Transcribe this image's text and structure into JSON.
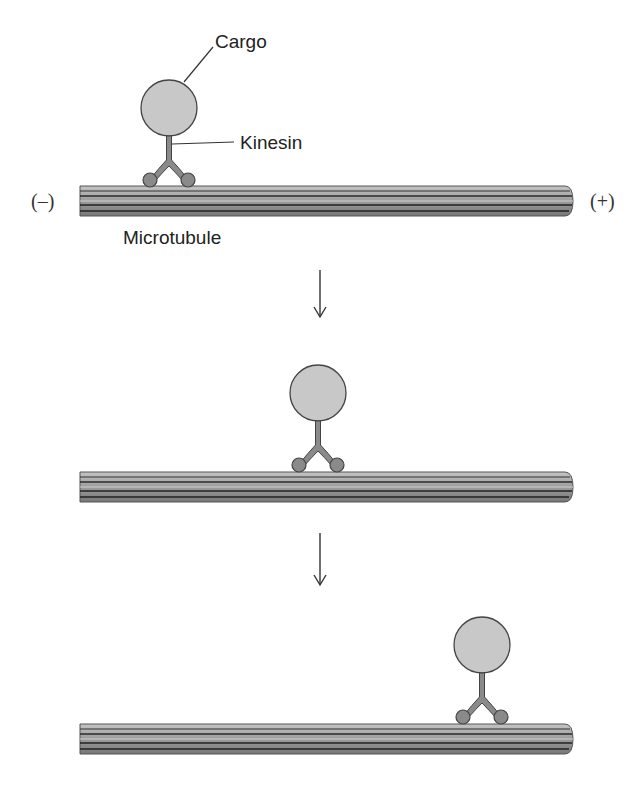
{
  "labels": {
    "cargo": "Cargo",
    "kinesin": "Kinesin",
    "microtubule": "Microtubule",
    "minus_end": "(–)",
    "plus_end": "(+)"
  },
  "panels": [
    {
      "step": 1,
      "cargo_x": 169,
      "description": "Kinesin carrying cargo near minus end of microtubule"
    },
    {
      "step": 2,
      "cargo_x": 318,
      "description": "Kinesin has moved toward middle of microtubule"
    },
    {
      "step": 3,
      "cargo_x": 482,
      "description": "Kinesin has moved near plus end of microtubule"
    }
  ],
  "arrows": [
    {
      "from_step": 1,
      "to_step": 2
    },
    {
      "from_step": 2,
      "to_step": 3
    }
  ],
  "colors": {
    "cargo_fill": "#c8c8c8",
    "outline": "#444444",
    "kinesin_fill": "#8a8a8a",
    "microtubule_light": "#bdbdbd",
    "microtubule_mid": "#9a9a9a",
    "microtubule_dark": "#2a2a2a"
  }
}
